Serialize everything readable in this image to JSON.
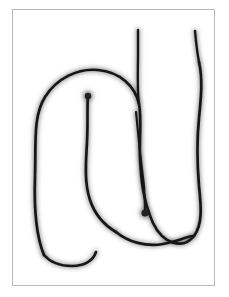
{
  "image": {
    "kind": "hand-drawn-sketch",
    "title": "Freehand contour sketch",
    "width": 229,
    "height": 297,
    "background_color": "#ffffff",
    "caption": ""
  },
  "frame": {
    "name": "paper border",
    "x": 12,
    "y": 9,
    "width": 203,
    "height": 277,
    "border_color": "#b9b9b9",
    "border_width": 1,
    "fill_color": "#ffffff"
  },
  "drawing": {
    "ink_color": "#151515",
    "soft_ink_color": "#3c3c3c",
    "stroke_width": 2.6,
    "description": "A single continuous freehand outline forming a rounded U / N like figure with two tall vertical tails rising from the top right, an inner hooked tip near the upper middle left, and a short interior stroke ending with a blob in the lower middle.",
    "strokes": [
      {
        "name": "outer-contour",
        "role": "main outline",
        "path": "M 44 255 C 36 236 34 205 35 176 C 36 143 33 116 45 97 C 57 78 78 68 98 70 C 120 72 135 86 139 104 C 142 118 139 140 140 158 C 141 180 143 200 153 223 C 163 244 183 250 194 236 C 203 224 201 205 199 186 C 197 162 197 138 199 118 C 201 98 203 80 199 62"
      },
      {
        "name": "left-vertical-tail",
        "role": "tail rising from top",
        "path": "M 139 104 C 137 90 138 70 138 55 C 138 44 138 36 138 30"
      },
      {
        "name": "right-vertical-tail",
        "role": "tail rising from top right",
        "path": "M 199 62 C 197 52 196 42 195 31"
      },
      {
        "name": "inner-hook",
        "role": "inner hook tip",
        "path": "M 88 95 C 87 106 88 124 87 142 C 86 162 84 182 90 200 C 95 215 104 225 116 232"
      },
      {
        "name": "inner-short-stroke",
        "role": "short interior stroke ending in blob",
        "path": "M 136 112 C 138 134 141 162 144 186 C 145 198 145 206 145 212"
      },
      {
        "name": "bottom-left-foot",
        "role": "bottom of left limb",
        "path": "M 44 255 C 50 262 60 266 72 266 C 84 266 93 261 96 252"
      },
      {
        "name": "bottom-right-bowl",
        "role": "bottom of right limb",
        "path": "M 116 232 C 128 242 146 247 163 244 C 180 241 190 235 194 236"
      }
    ],
    "blobs": [
      {
        "name": "inner-hook-tip-blob",
        "cx": 88,
        "cy": 96,
        "r": 3.2
      },
      {
        "name": "inner-stroke-end-blob",
        "cx": 145,
        "cy": 213,
        "r": 3.6
      }
    ]
  }
}
